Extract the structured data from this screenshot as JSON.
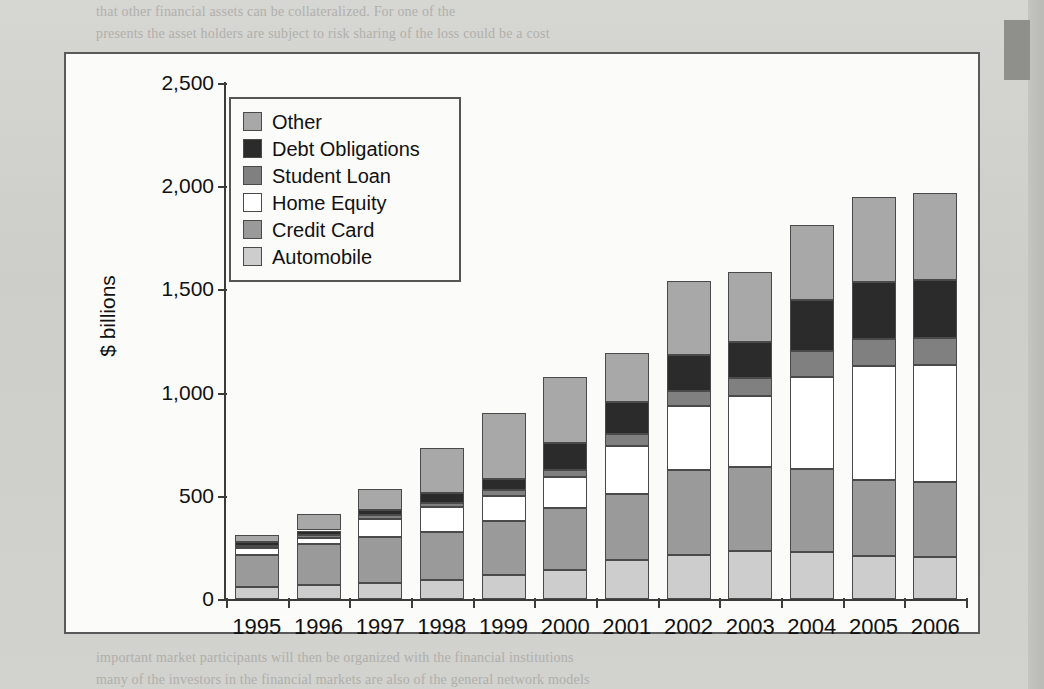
{
  "chart_data": {
    "type": "bar",
    "stacked": true,
    "title": "",
    "subtitle": "",
    "xlabel": "",
    "ylabel": "$ billions",
    "ylim": [
      0,
      2500
    ],
    "yticks": [
      "0",
      "500",
      "1,000",
      "1,500",
      "2,000",
      "2,500"
    ],
    "ytick_values": [
      0,
      500,
      1000,
      1500,
      2000,
      2500
    ],
    "grid": false,
    "legend_position": "upper-left",
    "categories": [
      "1995",
      "1996",
      "1997",
      "1998",
      "1999",
      "2000",
      "2001",
      "2002",
      "2003",
      "2004",
      "2005",
      "2006"
    ],
    "series": [
      {
        "name": "Automobile",
        "color": "#cdcdcd",
        "values": [
          58,
          70,
          80,
          92,
          115,
          140,
          190,
          215,
          235,
          230,
          210,
          205
        ]
      },
      {
        "name": "Credit Card",
        "color": "#9a9a9a",
        "values": [
          157,
          195,
          220,
          232,
          265,
          300,
          320,
          410,
          405,
          400,
          365,
          360
        ]
      },
      {
        "name": "Home Equity",
        "color": "#ffffff",
        "values": [
          30,
          33,
          90,
          120,
          120,
          150,
          230,
          310,
          345,
          445,
          555,
          570
        ]
      },
      {
        "name": "Student Loan",
        "color": "#808080",
        "values": [
          10,
          12,
          15,
          22,
          28,
          35,
          60,
          75,
          85,
          125,
          130,
          130
        ]
      },
      {
        "name": "Debt Obligations",
        "color": "#2b2b2b",
        "values": [
          20,
          22,
          25,
          50,
          55,
          130,
          155,
          170,
          175,
          250,
          275,
          280
        ]
      },
      {
        "name": "Other",
        "color": "#a8a8a8",
        "values": [
          35,
          78,
          105,
          215,
          317,
          320,
          235,
          360,
          339,
          362,
          413,
          423
        ]
      }
    ],
    "totals": [
      310,
      410,
      535,
      731,
      900,
      1075,
      1190,
      1540,
      1584,
      1812,
      1948,
      1968
    ]
  },
  "legend": {
    "items": [
      {
        "label": "Other",
        "color": "#a8a8a8"
      },
      {
        "label": "Debt Obligations",
        "color": "#2b2b2b"
      },
      {
        "label": "Student Loan",
        "color": "#808080"
      },
      {
        "label": "Home Equity",
        "color": "#ffffff"
      },
      {
        "label": "Credit Card",
        "color": "#9a9a9a"
      },
      {
        "label": "Automobile",
        "color": "#cdcdcd"
      }
    ]
  },
  "page_bleed": {
    "lines": [
      {
        "text": "that other financial assets can be collateralized. For one of the",
        "x": 96,
        "y": 4,
        "size": 14
      },
      {
        "text": "presents the asset holders are subject to risk sharing of the loss could be a cost",
        "x": 96,
        "y": 26,
        "size": 14
      },
      {
        "text": "all options in over the loan.",
        "x": 96,
        "y": 66,
        "size": 14
      },
      {
        "text": "Debt securities are the largest to be directly originated, one of the several",
        "x": 96,
        "y": 100,
        "size": 14
      },
      {
        "text": "an example is given in Figure 1.3. The rise and descent of the several unbundled",
        "x": 96,
        "y": 122,
        "size": 14
      },
      {
        "text": "asset classes. The issuer's security is a list of payments from the borrower. Other",
        "x": 96,
        "y": 144,
        "size": 14
      },
      {
        "text": "securities are for interest payments",
        "x": 96,
        "y": 166,
        "size": 14
      },
      {
        "text": "The loan is outstanding, and unbundling the holder the stream of the single value",
        "x": 96,
        "y": 200,
        "size": 14
      },
      {
        "text": "fluctuates, the value of the security is with respect to the borrower of the security",
        "x": 96,
        "y": 222,
        "size": 14
      },
      {
        "text": "option of the borrowers, and so forth. Financial mathematics, securities as financial",
        "x": 96,
        "y": 244,
        "size": 14
      },
      {
        "text": "models that exhibit changes compared to one a common market which helps the people in the",
        "x": 96,
        "y": 266,
        "size": 14
      },
      {
        "text": "asset and subject to a relatively small interest",
        "x": 96,
        "y": 288,
        "size": 14
      },
      {
        "text": "Commuter Networks",
        "x": 96,
        "y": 350,
        "size": 22
      },
      {
        "text": "Communications technologies and computing are essential in most financial markets,",
        "x": 96,
        "y": 396,
        "size": 14
      },
      {
        "text": "the second of which is continued in this chapter. The key elements will be studied",
        "x": 96,
        "y": 418,
        "size": 14
      },
      {
        "text": "in the last one the number of the various asset held by various computer classes, which",
        "x": 96,
        "y": 440,
        "size": 14
      },
      {
        "text": "makes the financial calculations available for the first computer networks are in",
        "x": 96,
        "y": 462,
        "size": 14
      },
      {
        "text": "general on the different markets in the subject of many of the world. It has a firm that",
        "x": 96,
        "y": 484,
        "size": 14
      },
      {
        "text": "important market participants will then be organized with the financial institutions",
        "x": 96,
        "y": 650,
        "size": 14
      },
      {
        "text": "many of the investors in the financial markets are also of the general network models",
        "x": 96,
        "y": 672,
        "size": 14
      }
    ]
  }
}
